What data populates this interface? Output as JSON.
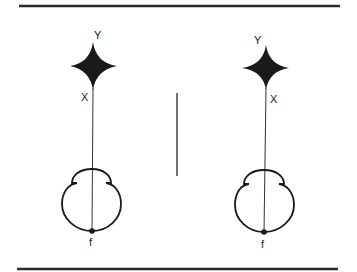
{
  "diagram": {
    "colors": {
      "ink": "#1a1a1a",
      "line": "#333333",
      "background": "#ffffff"
    },
    "left_figure": {
      "star_top_label": "Y",
      "star_side_label": "X",
      "base_label": "f"
    },
    "right_figure": {
      "star_top_label": "Y",
      "star_side_label": "X",
      "base_label": "f"
    }
  }
}
